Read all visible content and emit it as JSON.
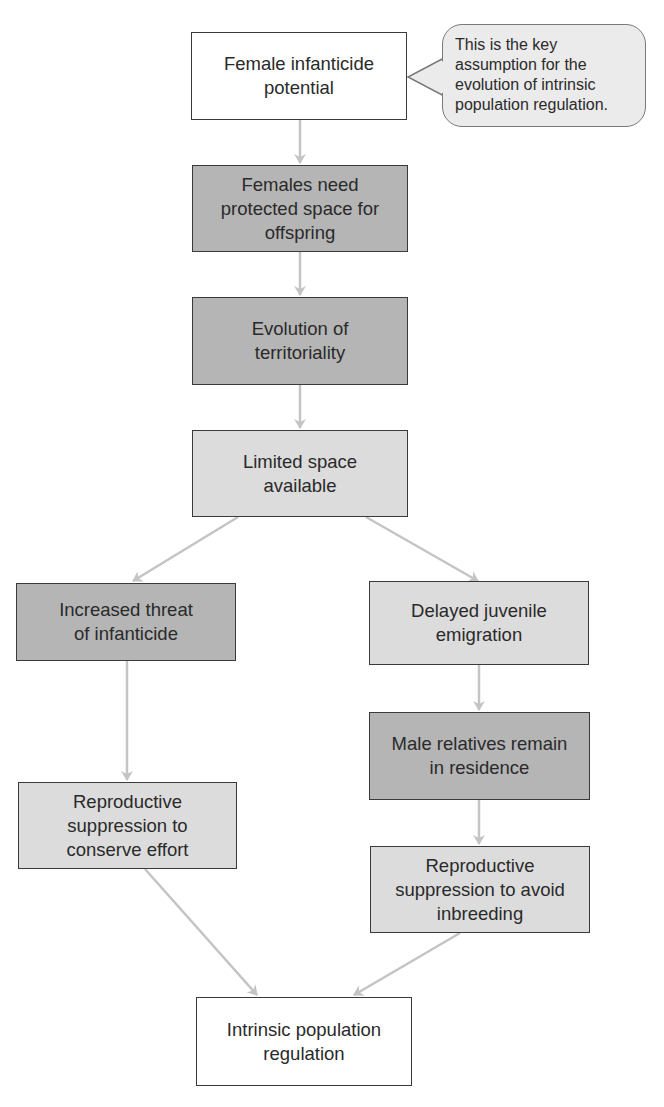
{
  "diagram": {
    "type": "flowchart",
    "colors": {
      "white_fill": "#ffffff",
      "light_fill": "#dcdcdc",
      "dark_fill": "#b5b5b5",
      "arrow": "#c4c4c4",
      "border": "#3a3a3a",
      "callout_fill": "#ebebeb"
    },
    "nodes": {
      "n1": {
        "label": "Female infanticide\npotential",
        "fill": "white"
      },
      "n2": {
        "label": "Females need\nprotected space for\noffspring",
        "fill": "dark"
      },
      "n3": {
        "label": "Evolution of\nterritoriality",
        "fill": "dark"
      },
      "n4": {
        "label": "Limited space\navailable",
        "fill": "light"
      },
      "n5": {
        "label": "Increased threat\nof infanticide",
        "fill": "dark"
      },
      "n6": {
        "label": "Delayed juvenile\nemigration",
        "fill": "light"
      },
      "n7": {
        "label": "Male relatives remain\nin residence",
        "fill": "dark"
      },
      "n8": {
        "label": "Reproductive\nsuppression to\nconserve effort",
        "fill": "light"
      },
      "n9": {
        "label": "Reproductive\nsuppression to avoid\ninbreeding",
        "fill": "light"
      },
      "n10": {
        "label": "Intrinsic population\nregulation",
        "fill": "white"
      }
    },
    "callout": {
      "text": "This is the key\nassumption for the\nevolution of intrinsic\npopulation regulation.",
      "attached_to": "n1"
    },
    "edges": [
      [
        "n1",
        "n2"
      ],
      [
        "n2",
        "n3"
      ],
      [
        "n3",
        "n4"
      ],
      [
        "n4",
        "n5"
      ],
      [
        "n4",
        "n6"
      ],
      [
        "n5",
        "n8"
      ],
      [
        "n6",
        "n7"
      ],
      [
        "n7",
        "n9"
      ],
      [
        "n8",
        "n10"
      ],
      [
        "n9",
        "n10"
      ]
    ]
  }
}
